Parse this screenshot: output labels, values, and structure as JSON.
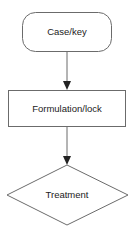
{
  "diagram": {
    "type": "flowchart",
    "nodes": [
      {
        "id": "n1",
        "shape": "rounded-rect",
        "label": "Case/key"
      },
      {
        "id": "n2",
        "shape": "rect",
        "label": "Formulation/lock"
      },
      {
        "id": "n3",
        "shape": "diamond",
        "label": "Treatment"
      }
    ],
    "edges": [
      {
        "from": "n1",
        "to": "n2"
      },
      {
        "from": "n2",
        "to": "n3"
      }
    ],
    "colors": {
      "stroke": "#6b6b6b",
      "arrow": "#222222",
      "text": "#222222",
      "background": "#ffffff"
    }
  }
}
